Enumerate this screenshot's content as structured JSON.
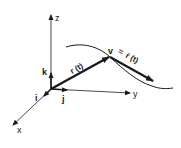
{
  "diagram": {
    "type": "3d-vector-kinematics",
    "colors": {
      "ink": "#1a1a1a",
      "background": "#ffffff"
    },
    "axes": {
      "z_label": "z",
      "y_label": "y",
      "x_label": "x"
    },
    "unit_vectors": {
      "i_label": "i",
      "j_label": "j",
      "k_label": "k"
    },
    "position_vector": {
      "label": "r (t)"
    },
    "velocity_vector": {
      "label_v": "v",
      "label_eq": "=",
      "label_rdot": "ṙ (t)"
    },
    "curve": {
      "description": "trajectory curve"
    }
  }
}
